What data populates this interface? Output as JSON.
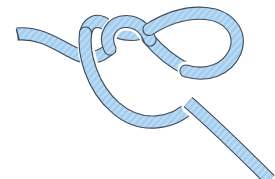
{
  "image": {
    "title": "Overhand knot rope illustration",
    "subject": "knot-diagram",
    "width": 275,
    "height": 179,
    "background_color": "#ffffff"
  },
  "rope": {
    "label": "rope",
    "fill_color": "#9fcaec",
    "fill_light": "#bcdcf5",
    "outline_color": "#3f4a5a",
    "outline_width": 1.1,
    "rope_width": 11,
    "texture": "diagonal-hatch",
    "texture_color": "#8cc0e8"
  },
  "strands": [
    {
      "name": "free-end-left",
      "description": "Blunt left tip, wavy horizontal strand running right, dips then rises into the knot, passing under the descending strand.",
      "path": "M 17 34 C 40 32, 56 44, 74 53 C 90 61, 100 58, 110 49"
    },
    {
      "name": "inner-small-loop",
      "description": "Small loop at top-center; strand rises from crossing, arcs over to the right and comes back down diagonally.",
      "path": "M 110 49 C 104 36, 112 22, 126 22 C 140 22, 146 32, 150 41"
    },
    {
      "name": "diagonal-to-right-loop",
      "description": "Diagonal strand going down-right, passing under the big loop's left side.",
      "path": "M 150 41 C 160 52, 172 62, 186 70"
    },
    {
      "name": "big-right-loop",
      "description": "Large outer loop on the right, arcs up over the top, right and down around.",
      "path": "M 186 70 C 206 76, 226 70, 234 52 C 242 33, 228 16, 206 14 C 184 12, 164 20, 148 30"
    },
    {
      "name": "upper-left-arc",
      "description": "Strand sweeping from the right loop back left across the top to the left side of the knot.",
      "path": "M 148 30 C 132 38, 118 34, 108 26 C 98 18, 88 22, 86 34"
    },
    {
      "name": "bottom-big-arc",
      "description": "Large bottom arc descending on the left, curving under and sweeping right.",
      "path": "M 86 34 C 84 52, 92 86, 116 108 C 140 130, 172 124, 190 106"
    },
    {
      "name": "tail-bottom-right",
      "description": "Working end exiting toward the bottom-right corner of the frame.",
      "path": "M 190 106 C 212 124, 240 150, 268 178"
    }
  ],
  "crossings": [
    {
      "name": "crossing-left-under",
      "x": 104,
      "y": 42,
      "over": "bottom-big-arc",
      "under": "free-end-left"
    },
    {
      "name": "crossing-center-over",
      "x": 140,
      "y": 33,
      "over": "inner-small-loop",
      "under": "upper-left-arc"
    },
    {
      "name": "crossing-right-under",
      "x": 184,
      "y": 68,
      "over": "big-right-loop",
      "under": "diagonal-to-right-loop"
    },
    {
      "name": "crossing-bottom-over",
      "x": 191,
      "y": 104,
      "over": "tail-bottom-right",
      "under": "bottom-big-arc"
    }
  ]
}
